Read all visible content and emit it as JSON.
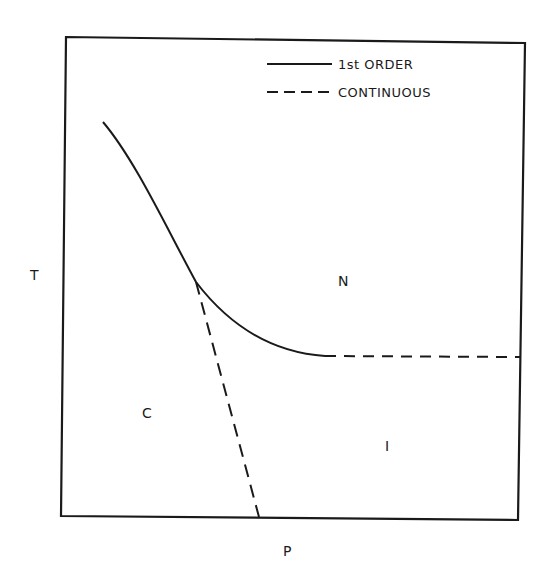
{
  "diagram": {
    "type": "phase-diagram",
    "axes": {
      "x_label": "P",
      "y_label": "T"
    },
    "legend": {
      "items": [
        {
          "label": "1st ORDER",
          "line_style": "solid"
        },
        {
          "label": "CONTINUOUS",
          "line_style": "dashed"
        }
      ]
    },
    "regions": [
      {
        "id": "N",
        "label": "N"
      },
      {
        "id": "C",
        "label": "C"
      },
      {
        "id": "I",
        "label": "I"
      }
    ],
    "boundaries": [
      {
        "name": "C-N boundary",
        "type": "1st ORDER",
        "style": "solid"
      },
      {
        "name": "N-I boundary (curved part)",
        "type": "1st ORDER",
        "style": "solid"
      },
      {
        "name": "N-I boundary (horizontal)",
        "type": "CONTINUOUS",
        "style": "dashed"
      },
      {
        "name": "C-I boundary",
        "type": "CONTINUOUS",
        "style": "dashed"
      }
    ],
    "colors": {
      "ink": "#1a1a1a",
      "background": "#ffffff"
    }
  }
}
